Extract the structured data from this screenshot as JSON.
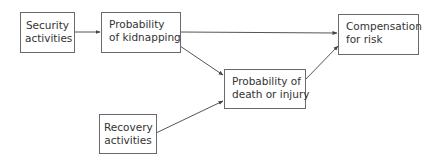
{
  "diagram": {
    "type": "flow",
    "nodes": {
      "security": {
        "line1": "Security",
        "line2": "activities"
      },
      "kidnap": {
        "line1": "Probability",
        "line2": "of kidnapping"
      },
      "compensation": {
        "line1": "Compensation",
        "line2": "for risk"
      },
      "death": {
        "line1": "Probability of",
        "line2": "death or injury"
      },
      "recovery": {
        "line1": "Recovery",
        "line2": "activities"
      }
    },
    "edges": [
      {
        "from": "Security activities",
        "to": "Probability of kidnapping"
      },
      {
        "from": "Probability of kidnapping",
        "to": "Compensation for risk"
      },
      {
        "from": "Probability of kidnapping",
        "to": "Probability of death or injury"
      },
      {
        "from": "Recovery activities",
        "to": "Probability of death or injury"
      },
      {
        "from": "Probability of death or injury",
        "to": "Compensation for risk"
      }
    ],
    "colors": {
      "line": "#555555",
      "border": "#6a6a6a",
      "text": "#333333"
    }
  }
}
